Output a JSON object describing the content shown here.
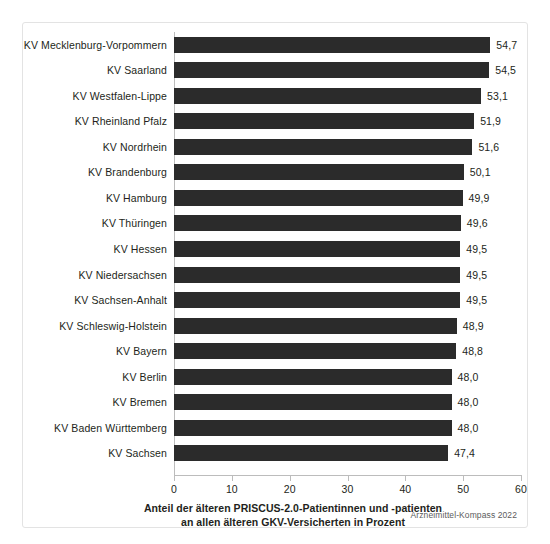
{
  "chart_data": {
    "type": "bar",
    "orientation": "horizontal",
    "title": "",
    "xlabel": "Anteil der älteren PRISCUS-2.0-Patientinnen und -patienten an allen älteren GKV-Versicherten in Prozent",
    "ylabel": "",
    "xlim": [
      0,
      60
    ],
    "xticks": [
      0,
      10,
      20,
      30,
      40,
      50,
      60
    ],
    "xtick_labels": [
      "0",
      "10",
      "20",
      "30",
      "40",
      "50",
      "60"
    ],
    "grid": false,
    "legend": false,
    "bar_color": "#2b2b2b",
    "decimal_separator": ",",
    "categories": [
      "KV Mecklenburg-Vorpommern",
      "KV Saarland",
      "KV Westfalen-Lippe",
      "KV Rheinland Pfalz",
      "KV Nordrhein",
      "KV Brandenburg",
      "KV Hamburg",
      "KV Thüringen",
      "KV Hessen",
      "KV Niedersachsen",
      "KV Sachsen-Anhalt",
      "KV Schleswig-Holstein",
      "KV Bayern",
      "KV Berlin",
      "KV Bremen",
      "KV Baden Württemberg",
      "KV Sachsen"
    ],
    "values": [
      54.7,
      54.5,
      53.1,
      51.9,
      51.6,
      50.1,
      49.9,
      49.6,
      49.5,
      49.5,
      49.5,
      48.9,
      48.8,
      48.0,
      48.0,
      48.0,
      47.4
    ],
    "value_labels": [
      "54,7",
      "54,5",
      "53,1",
      "51,9",
      "51,6",
      "50,1",
      "49,9",
      "49,6",
      "49,5",
      "49,5",
      "49,5",
      "48,9",
      "48,8",
      "48,0",
      "48,0",
      "48,0",
      "47,4"
    ]
  },
  "caption": {
    "line1": "Anteil der älteren PRISCUS-2.0-Patientinnen und -patienten",
    "line2": "an allen älteren GKV-Versicherten in Prozent"
  },
  "source": {
    "text": "Arzneimittel-Kompass 2022"
  }
}
